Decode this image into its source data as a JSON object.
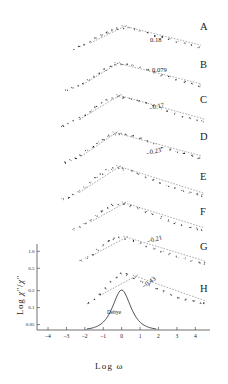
{
  "figure": {
    "axes": {
      "xlabel": "Log ω",
      "ylabel_parts": {
        "pre": "Log ",
        "chi1": "χ",
        "sup1": "″",
        "slash": "/",
        "chi2": "χ",
        "sup2": "″"
      },
      "ylabel_plain": "Log χ″/χ″",
      "xticks": [
        "-4",
        "-3",
        "-2",
        "-1",
        "0",
        "1",
        "2",
        "3",
        "4"
      ],
      "yticks": [
        "1.0",
        "0.5",
        "0.2",
        "0.1",
        "0.05"
      ]
    },
    "reference_curve_label": "Debye",
    "curve_letters": [
      "A",
      "B",
      "C",
      "D",
      "E",
      "F",
      "G",
      "H"
    ],
    "slope_annotations": [
      "0.18",
      "0.079",
      "-0.17",
      "-0.23",
      "-0.21",
      "-0.43"
    ],
    "colors": {
      "ink": "#1a1a1a",
      "axis": "#333333",
      "marker": "#222222"
    }
  },
  "chart_data": {
    "type": "scatter",
    "title": "",
    "xlabel": "Log ω",
    "ylabel": "Log χ″/χ″m",
    "xlim": [
      -4.6,
      4.8
    ],
    "ylim": [
      0.02,
      1.25
    ],
    "xticks": [
      -4,
      -3,
      -2,
      -1,
      0,
      1,
      2,
      3,
      4
    ],
    "yticks": [
      1.0,
      0.5,
      0.2,
      0.1,
      0.05
    ],
    "ytick_labels": [
      "1.0",
      "0.5",
      "0.2",
      "0.1",
      "0.05"
    ],
    "grid": false,
    "legend": "none",
    "series": [
      {
        "name": "A",
        "letter": "A",
        "slope_label": "",
        "peak_x": 0.2,
        "x": [
          -2.6,
          -2.3,
          -2.0,
          -1.7,
          -1.4,
          -1.1,
          -0.8,
          -0.5,
          -0.2,
          0.1,
          0.4,
          0.7,
          1.0,
          1.4,
          1.8,
          2.2,
          2.6,
          3.0,
          3.4,
          3.8,
          4.2
        ],
        "y": [
          0.28,
          0.36,
          0.45,
          0.55,
          0.66,
          0.76,
          0.86,
          0.93,
          0.98,
          1.0,
          0.99,
          0.96,
          0.91,
          0.84,
          0.76,
          0.69,
          0.62,
          0.55,
          0.48,
          0.42,
          0.36
        ]
      },
      {
        "name": "B",
        "letter": "B",
        "slope_label": "0.18",
        "peak_x": 0.1,
        "x": [
          -3.0,
          -2.7,
          -2.4,
          -2.1,
          -1.8,
          -1.5,
          -1.2,
          -0.9,
          -0.6,
          -0.3,
          0.0,
          0.3,
          0.6,
          1.0,
          1.4,
          1.8,
          2.2,
          2.6,
          3.0,
          3.4,
          3.8,
          4.2
        ],
        "y": [
          0.2,
          0.26,
          0.33,
          0.41,
          0.5,
          0.6,
          0.71,
          0.82,
          0.91,
          0.97,
          1.0,
          0.99,
          0.96,
          0.9,
          0.82,
          0.74,
          0.66,
          0.58,
          0.51,
          0.44,
          0.38,
          0.32
        ]
      },
      {
        "name": "C",
        "letter": "C",
        "slope_label": "0.079",
        "peak_x": -0.1,
        "x": [
          -3.2,
          -2.9,
          -2.6,
          -2.3,
          -2.0,
          -1.7,
          -1.4,
          -1.1,
          -0.8,
          -0.5,
          -0.2,
          0.1,
          0.5,
          0.9,
          1.3,
          1.7,
          2.1,
          2.5,
          2.9,
          3.3,
          3.7,
          4.1,
          4.4
        ],
        "y": [
          0.15,
          0.21,
          0.29,
          0.38,
          0.48,
          0.59,
          0.71,
          0.82,
          0.91,
          0.97,
          1.0,
          0.99,
          0.95,
          0.89,
          0.82,
          0.74,
          0.66,
          0.58,
          0.51,
          0.44,
          0.38,
          0.33,
          0.29
        ]
      },
      {
        "name": "D",
        "letter": "D",
        "slope_label": "-0.17",
        "peak_x": -0.2,
        "x": [
          -3.1,
          -2.8,
          -2.5,
          -2.2,
          -1.9,
          -1.6,
          -1.3,
          -1.0,
          -0.7,
          -0.4,
          -0.1,
          0.2,
          0.6,
          1.0,
          1.4,
          1.8,
          2.2,
          2.6,
          3.0,
          3.4,
          3.8,
          4.2
        ],
        "y": [
          0.16,
          0.22,
          0.3,
          0.39,
          0.5,
          0.62,
          0.74,
          0.85,
          0.94,
          0.99,
          1.0,
          0.98,
          0.93,
          0.86,
          0.78,
          0.7,
          0.62,
          0.54,
          0.47,
          0.41,
          0.35,
          0.3
        ]
      },
      {
        "name": "E",
        "letter": "E",
        "slope_label": "-0.23",
        "peak_x": -0.25,
        "x": [
          -3.2,
          -2.9,
          -2.6,
          -2.3,
          -2.0,
          -1.7,
          -1.4,
          -1.1,
          -0.8,
          -0.5,
          -0.2,
          0.1,
          0.5,
          0.9,
          1.3,
          1.7,
          2.1,
          2.5,
          2.9,
          3.3,
          3.7,
          4.1,
          4.4
        ],
        "y": [
          0.13,
          0.19,
          0.27,
          0.36,
          0.47,
          0.59,
          0.72,
          0.84,
          0.94,
          0.99,
          1.0,
          0.97,
          0.91,
          0.83,
          0.74,
          0.66,
          0.58,
          0.5,
          0.43,
          0.37,
          0.32,
          0.27,
          0.24
        ]
      },
      {
        "name": "F",
        "letter": "F",
        "slope_label": "",
        "peak_x": -0.15,
        "x": [
          -2.6,
          -2.3,
          -2.0,
          -1.7,
          -1.4,
          -1.1,
          -0.8,
          -0.5,
          -0.2,
          0.1,
          0.5,
          0.9,
          1.3,
          1.7,
          2.1,
          2.5,
          2.9,
          3.3,
          3.7,
          4.1,
          4.4
        ],
        "y": [
          0.3,
          0.36,
          0.44,
          0.54,
          0.66,
          0.79,
          0.9,
          0.97,
          1.0,
          0.99,
          0.94,
          0.87,
          0.79,
          0.71,
          0.63,
          0.55,
          0.48,
          0.42,
          0.36,
          0.31,
          0.28
        ]
      },
      {
        "name": "G",
        "letter": "G",
        "slope_label": "-0.21",
        "peak_x": -0.2,
        "x": [
          -2.2,
          -1.9,
          -1.6,
          -1.3,
          -1.0,
          -0.7,
          -0.4,
          -0.1,
          0.2,
          0.6,
          1.0,
          1.4,
          1.8,
          2.2,
          2.6,
          3.0,
          3.4,
          3.8,
          4.2,
          4.5
        ],
        "y": [
          0.33,
          0.42,
          0.53,
          0.65,
          0.78,
          0.9,
          0.98,
          1.0,
          0.98,
          0.92,
          0.85,
          0.76,
          0.68,
          0.6,
          0.52,
          0.45,
          0.39,
          0.33,
          0.28,
          0.25
        ]
      },
      {
        "name": "H",
        "letter": "H",
        "slope_label": "-0.43",
        "peak_x": -0.1,
        "x": [
          -1.8,
          -1.5,
          -1.2,
          -0.9,
          -0.6,
          -0.3,
          0.0,
          0.3,
          0.7,
          1.1,
          1.5,
          1.9,
          2.3,
          2.7,
          3.1,
          3.5,
          3.9,
          4.3,
          4.5
        ],
        "y": [
          0.18,
          0.3,
          0.44,
          0.6,
          0.77,
          0.92,
          1.0,
          0.98,
          0.9,
          0.8,
          0.7,
          0.6,
          0.51,
          0.43,
          0.36,
          0.3,
          0.25,
          0.21,
          0.19
        ]
      },
      {
        "name": "Debye",
        "letter": "",
        "slope_label": "",
        "reference": true,
        "peak_x": 0.0,
        "x": [
          -1.6,
          -1.3,
          -1.0,
          -0.7,
          -0.4,
          -0.1,
          0.2,
          0.5,
          0.8,
          1.1,
          1.4,
          1.7
        ],
        "y": [
          0.06,
          0.12,
          0.24,
          0.46,
          0.76,
          0.99,
          0.96,
          0.72,
          0.44,
          0.23,
          0.11,
          0.05
        ]
      }
    ]
  }
}
